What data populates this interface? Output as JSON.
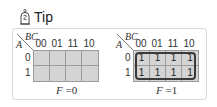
{
  "tip": {
    "label": "Tip",
    "icon": "tip-bulb-icon"
  },
  "kmaps": [
    {
      "row_var": "A",
      "col_var": "BC",
      "col_headers": [
        "00",
        "01",
        "11",
        "10"
      ],
      "row_headers": [
        "0",
        "1"
      ],
      "cells": [
        [
          "",
          "",
          "",
          ""
        ],
        [
          "",
          "",
          "",
          ""
        ]
      ],
      "equation": {
        "lhs": "F",
        "eq": "=",
        "rhs": "0"
      },
      "grouped": false
    },
    {
      "row_var": "A",
      "col_var": "BC",
      "col_headers": [
        "00",
        "01",
        "11",
        "10"
      ],
      "row_headers": [
        "0",
        "1"
      ],
      "cells": [
        [
          "1",
          "1",
          "1",
          "1"
        ],
        [
          "1",
          "1",
          "1",
          "1"
        ]
      ],
      "equation": {
        "lhs": "F",
        "eq": "=",
        "rhs": "1"
      },
      "grouped": true
    }
  ],
  "colors": {
    "cell_fill": "#d4d4d4",
    "grid_line": "#9a9a9a",
    "loop": "#3a3a3a",
    "frame": "#d6d6d6"
  }
}
